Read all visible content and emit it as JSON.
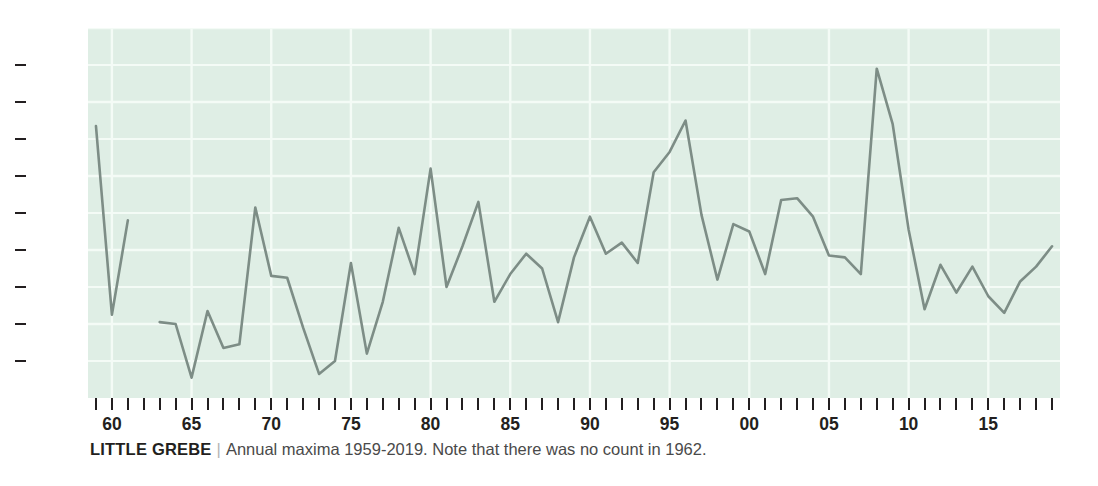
{
  "caption": {
    "species": "LITTLE GREBE",
    "separator": "|",
    "note": "Annual maxima 1959-2019. Note that there was no count in 1962."
  },
  "colors": {
    "plot_background": "#dfeee5",
    "gridline": "#f4fbf6",
    "line": "#7d8d86",
    "text": "#231f20",
    "caption_text": "#4a4a4a"
  },
  "chart_data": {
    "type": "line",
    "title": "LITTLE GREBE",
    "subtitle": "Annual maxima 1959-2019. Note that there was no count in 1962.",
    "xlabel": "",
    "ylabel": "",
    "xlim": [
      1958.5,
      2019.5
    ],
    "ylim": [
      0,
      200
    ],
    "grid": true,
    "legend": "none",
    "y_ticks": [
      0,
      20,
      40,
      60,
      80,
      100,
      120,
      140,
      160,
      180,
      200
    ],
    "y_tick_labels": [
      "0",
      "20",
      "40",
      "60",
      "80",
      "100",
      "120",
      "140",
      "160",
      "180",
      "200"
    ],
    "x_tick_years": [
      1959,
      1960,
      1961,
      1962,
      1963,
      1964,
      1965,
      1966,
      1967,
      1968,
      1969,
      1970,
      1971,
      1972,
      1973,
      1974,
      1975,
      1976,
      1977,
      1978,
      1979,
      1980,
      1981,
      1982,
      1983,
      1984,
      1985,
      1986,
      1987,
      1988,
      1989,
      1990,
      1991,
      1992,
      1993,
      1994,
      1995,
      1996,
      1997,
      1998,
      1999,
      2000,
      2001,
      2002,
      2003,
      2004,
      2005,
      2006,
      2007,
      2008,
      2009,
      2010,
      2011,
      2012,
      2013,
      2014,
      2015,
      2016,
      2017,
      2018,
      2019
    ],
    "x_labeled_ticks": [
      {
        "year": 1960,
        "label": "60"
      },
      {
        "year": 1965,
        "label": "65"
      },
      {
        "year": 1970,
        "label": "70"
      },
      {
        "year": 1975,
        "label": "75"
      },
      {
        "year": 1980,
        "label": "80"
      },
      {
        "year": 1985,
        "label": "85"
      },
      {
        "year": 1990,
        "label": "90"
      },
      {
        "year": 1995,
        "label": "95"
      },
      {
        "year": 2000,
        "label": "00"
      },
      {
        "year": 2005,
        "label": "05"
      },
      {
        "year": 2010,
        "label": "10"
      },
      {
        "year": 2015,
        "label": "15"
      }
    ],
    "x": [
      1959,
      1960,
      1961,
      1962,
      1963,
      1964,
      1965,
      1966,
      1967,
      1968,
      1969,
      1970,
      1971,
      1972,
      1973,
      1974,
      1975,
      1976,
      1977,
      1978,
      1979,
      1980,
      1981,
      1982,
      1983,
      1984,
      1985,
      1986,
      1987,
      1988,
      1989,
      1990,
      1991,
      1992,
      1993,
      1994,
      1995,
      1996,
      1997,
      1998,
      1999,
      2000,
      2001,
      2002,
      2003,
      2004,
      2005,
      2006,
      2007,
      2008,
      2009,
      2010,
      2011,
      2012,
      2013,
      2014,
      2015,
      2016,
      2017,
      2018,
      2019
    ],
    "values": [
      147,
      45,
      96,
      null,
      41,
      40,
      11,
      47,
      27,
      29,
      103,
      66,
      65,
      38,
      13,
      20,
      73,
      24,
      52,
      92,
      67,
      124,
      60,
      82,
      106,
      52,
      67,
      78,
      70,
      41,
      76,
      98,
      78,
      84,
      73,
      122,
      133,
      150,
      99,
      64,
      94,
      90,
      67,
      107,
      108,
      98,
      77,
      76,
      67,
      178,
      148,
      91,
      48,
      72,
      57,
      71,
      55,
      46,
      63,
      71,
      82
    ]
  }
}
